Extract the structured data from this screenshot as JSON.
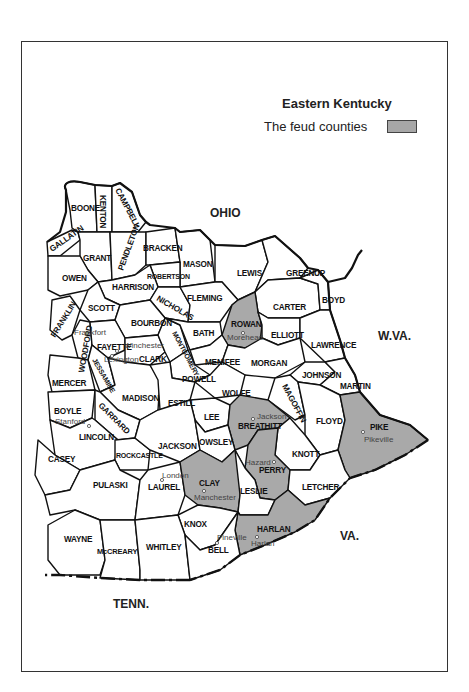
{
  "legend": {
    "title": "Eastern Kentucky",
    "item_label": "The feud counties",
    "swatch_color": "#a9a9a9"
  },
  "neighbors": {
    "ohio": "OHIO",
    "wva": "W.VA.",
    "va": "VA.",
    "tenn": "TENN."
  },
  "counties": {
    "boone": "BOONE",
    "kenton": "KENTON",
    "campbell": "CAMPBELL",
    "gallatin": "GALLATIN",
    "grant": "GRANT",
    "pendleton": "PENDLETON",
    "bracken": "BRACKEN",
    "mason": "MASON",
    "owen": "OWEN",
    "robertson": "ROBERTSON",
    "harrison": "HARRISON",
    "lewis": "LEWIS",
    "greenup": "GREENUP",
    "scott": "SCOTT",
    "nicholas": "NICHOLAS",
    "fleming": "FLEMING",
    "carter": "CARTER",
    "boyd": "BOYD",
    "franklin": "FRANKLIN",
    "bourbon": "BOURBON",
    "rowan": "ROWAN",
    "elliott": "ELLIOTT",
    "woodford": "WOODFORD",
    "fayette": "FAYETTE",
    "clark": "CLARK",
    "montgomery": "MONTGOMERY",
    "bath": "BATH",
    "lawrence": "LAWRENCE",
    "menifee": "MENIFEE",
    "morgan": "MORGAN",
    "jessamine": "JESSAMINE",
    "mercer": "MERCER",
    "madison": "MADISON",
    "powell": "POWELL",
    "estill": "ESTILL",
    "wolfe": "WOLFE",
    "johnson": "JOHNSON",
    "martin": "MARTIN",
    "magoffin": "MAGOFFIN",
    "boyle": "BOYLE",
    "garrard": "GARRARD",
    "lee": "LEE",
    "breathitt": "BREATHITT",
    "floyd": "FLOYD",
    "pike": "PIKE",
    "lincoln": "LINCOLN",
    "casey": "CASEY",
    "rockcastle": "ROCKCASTLE",
    "jackson": "JACKSON",
    "owsley": "OWSLEY",
    "knott": "KNOTT",
    "perry": "PERRY",
    "pulaski": "PULASKI",
    "laurel": "LAUREL",
    "clay": "CLAY",
    "leslie": "LESLIE",
    "letcher": "LETCHER",
    "knox": "KNOX",
    "harlan": "HARLAN",
    "wayne": "WAYNE",
    "mccreary": "McCREARY",
    "whitley": "WHITLEY",
    "bell": "BELL"
  },
  "feud_counties": [
    "ROWAN",
    "BREATHITT",
    "PIKE",
    "PERRY",
    "CLAY",
    "HARLAN"
  ],
  "towns": {
    "frankfort": "Frankfort",
    "winchester": "Winchester",
    "lexington": "Lexington",
    "morehead": "Morehead",
    "stanford": "Stanford",
    "jackson": "Jackson",
    "pikeville": "Pikeville",
    "hazard": "Hazard",
    "london": "London",
    "manchester": "Manchester",
    "pineville": "Pineville",
    "harlan": "Harlan"
  }
}
